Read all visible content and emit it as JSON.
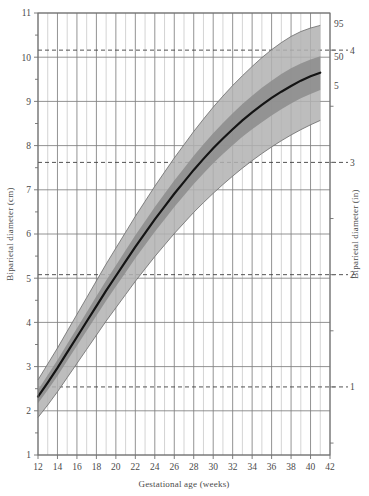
{
  "chart_data": {
    "type": "line",
    "title": "",
    "xlabel": "Gestational age (weeks)",
    "ylabel": "Biparietal diameter (cm)",
    "ylabel_right": "Biparietal diameter (in)",
    "xlim": [
      12,
      42
    ],
    "ylim": [
      1,
      11
    ],
    "ylim_right": [
      0.3937,
      4.3307
    ],
    "grid": true,
    "legend_position": "right-inline",
    "xticks": [
      12,
      14,
      16,
      18,
      20,
      22,
      24,
      26,
      28,
      30,
      32,
      34,
      36,
      38,
      40,
      42
    ],
    "xticks_minor": [
      13,
      15,
      17,
      19,
      21,
      23,
      25,
      27,
      29,
      31,
      33,
      35,
      37,
      39,
      41
    ],
    "yticks": [
      1,
      2,
      3,
      4,
      5,
      6,
      7,
      8,
      9,
      10,
      11
    ],
    "yticks_minor": [
      1.5,
      2.5,
      3.5,
      4.5,
      5.5,
      6.5,
      7.5,
      8.5,
      9.5,
      10.5
    ],
    "yticks_right": [
      1,
      2,
      3,
      4
    ],
    "yticks_right_cm": [
      2.54,
      5.08,
      7.62,
      10.16
    ],
    "yticks_right_minor": [
      0.5,
      1.5,
      2.5,
      3.5
    ],
    "inch_gridline_style": "dashed",
    "annotations": [
      {
        "text": "95",
        "x": 42.3,
        "y": 10.75
      },
      {
        "text": "50",
        "x": 42.3,
        "y": 10.02
      },
      {
        "text": "5",
        "x": 42.3,
        "y": 9.35
      }
    ],
    "x": [
      12,
      13,
      14,
      15,
      16,
      17,
      18,
      19,
      20,
      21,
      22,
      23,
      24,
      25,
      26,
      27,
      28,
      29,
      30,
      31,
      32,
      33,
      34,
      35,
      36,
      37,
      38,
      39,
      40,
      41
    ],
    "series": [
      {
        "name": "95",
        "label": "95th percentile",
        "color": "#b2b2b2",
        "values": [
          2.7,
          3.06,
          3.42,
          3.8,
          4.18,
          4.56,
          4.94,
          5.32,
          5.68,
          6.04,
          6.4,
          6.74,
          7.08,
          7.4,
          7.72,
          8.02,
          8.32,
          8.6,
          8.87,
          9.12,
          9.36,
          9.58,
          9.79,
          9.99,
          10.17,
          10.33,
          10.47,
          10.58,
          10.66,
          10.72
        ]
      },
      {
        "name": "75",
        "label": "75th percentile",
        "color": "#8c8c8c",
        "values": [
          2.47,
          2.81,
          3.15,
          3.51,
          3.87,
          4.23,
          4.59,
          4.95,
          5.29,
          5.63,
          5.97,
          6.29,
          6.61,
          6.91,
          7.21,
          7.49,
          7.77,
          8.03,
          8.28,
          8.51,
          8.73,
          8.94,
          9.13,
          9.31,
          9.47,
          9.62,
          9.75,
          9.86,
          9.95,
          10.02
        ]
      },
      {
        "name": "50",
        "label": "50th percentile (median)",
        "color": "#1a1a1a",
        "values": [
          2.32,
          2.64,
          2.97,
          3.32,
          3.67,
          4.02,
          4.37,
          4.72,
          5.05,
          5.38,
          5.71,
          6.02,
          6.33,
          6.62,
          6.91,
          7.18,
          7.45,
          7.7,
          7.94,
          8.16,
          8.37,
          8.57,
          8.75,
          8.92,
          9.08,
          9.22,
          9.35,
          9.47,
          9.57,
          9.65
        ]
      },
      {
        "name": "25",
        "label": "25th percentile",
        "color": "#8c8c8c",
        "values": [
          2.17,
          2.47,
          2.79,
          3.13,
          3.47,
          3.81,
          4.15,
          4.49,
          4.81,
          5.13,
          5.45,
          5.75,
          6.05,
          6.33,
          6.61,
          6.87,
          7.13,
          7.37,
          7.6,
          7.81,
          8.01,
          8.2,
          8.37,
          8.53,
          8.68,
          8.82,
          8.95,
          9.07,
          9.17,
          9.26
        ]
      },
      {
        "name": "5",
        "label": "5th percentile",
        "color": "#b2b2b2",
        "values": [
          1.85,
          2.13,
          2.43,
          2.75,
          3.07,
          3.39,
          3.71,
          4.03,
          4.33,
          4.63,
          4.93,
          5.21,
          5.49,
          5.75,
          6.01,
          6.25,
          6.49,
          6.71,
          6.92,
          7.12,
          7.31,
          7.49,
          7.66,
          7.82,
          7.97,
          8.11,
          8.24,
          8.36,
          8.47,
          8.57
        ]
      }
    ],
    "bands": [
      {
        "name": "5-95 band",
        "lower": "5",
        "upper": "95",
        "color": "#b2b2b2"
      },
      {
        "name": "25-75 band",
        "lower": "25",
        "upper": "75",
        "color": "#8c8c8c"
      }
    ]
  },
  "colors": {
    "grid": "#808080",
    "axis": "#6f6f6f",
    "text": "#4a4a4a",
    "median_line": "#141414",
    "band_outer": "#b2b2b2",
    "band_inner": "#8c8c8c",
    "background": "#ffffff"
  }
}
